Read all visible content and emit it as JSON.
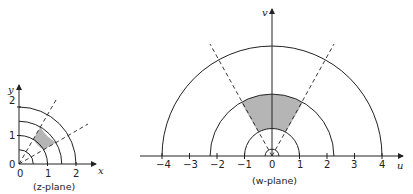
{
  "z_plane": {
    "caption": "(z-plane)",
    "x_axis_label": "x",
    "y_axis_label": "y",
    "origin_label": "0",
    "x_ticks": [
      "0",
      "1",
      "2"
    ],
    "y_ticks": [
      "1",
      "2"
    ],
    "circle_radii": [
      0.5,
      1,
      1.5,
      2
    ],
    "dashed_ray_angles_deg": [
      30,
      60
    ],
    "shaded_region": {
      "r_min": 1,
      "r_max": 1.5,
      "theta_min_deg": 30,
      "theta_max_deg": 60
    }
  },
  "w_plane": {
    "caption": "(w-plane)",
    "u_axis_label": "u",
    "v_axis_label": "v",
    "u_ticks": [
      "−4",
      "−3",
      "−2",
      "−1",
      "0",
      "1",
      "2",
      "3",
      "4"
    ],
    "circle_radii": [
      0.25,
      1,
      2.25,
      4
    ],
    "dashed_ray_angles_deg": [
      60,
      120
    ],
    "shaded_region": {
      "r_min": 1,
      "r_max": 2.25,
      "theta_min_deg": 60,
      "theta_max_deg": 120
    }
  },
  "colors": {
    "line": "#222222",
    "shade": "#b5b5b5"
  }
}
